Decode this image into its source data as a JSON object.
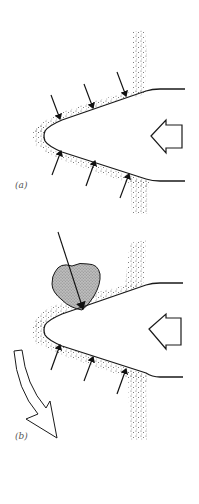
{
  "figure": {
    "panels": [
      {
        "label": "(a)",
        "description": "Wedge-shaped body pushed leftward into granular stippled medium; small arrows show uniform inward pressure on upper and lower faces",
        "push_direction": "left",
        "upper_arrows": 3,
        "lower_arrows": 3
      },
      {
        "label": "(b)",
        "description": "Same wedge with a rock (shaded clast) on upper face receiving a large concentrated force; lower face still has 3 small arrows; curved hollow arrow indicates downward deflection",
        "push_direction": "left",
        "upper_arrows": 0,
        "lower_arrows": 3,
        "has_rock": true,
        "has_deflection_arrow": true
      }
    ]
  },
  "colors": {
    "line": "#1a1a1a",
    "stipple": "#555555",
    "rock_fill": "#b8b8b8",
    "background": "#ffffff"
  }
}
